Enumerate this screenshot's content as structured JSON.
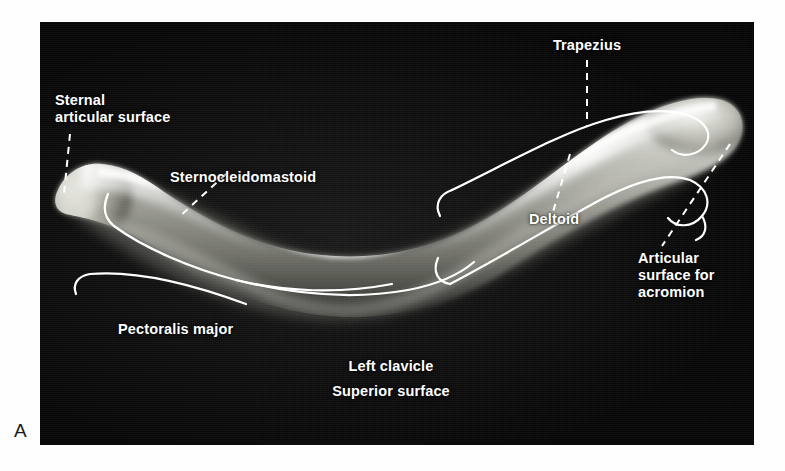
{
  "figure": {
    "panel_letter": "A",
    "caption_lines": [
      "Left clavicle",
      "Superior surface"
    ],
    "background_color": "#050505",
    "label_color": "#ffffff",
    "overlay_color": "#ffffff",
    "page_background": "#ffffff"
  },
  "labels": {
    "sternal_articular_surface": {
      "line1": "Sternal",
      "line2": "articular surface"
    },
    "sternocleidomastoid": "Sternocleidomastoid",
    "trapezius": "Trapezius",
    "deltoid": "Deltoid",
    "articular_surface_for_acromion": {
      "line1": "Articular",
      "line2": "surface for",
      "line3": "acromion"
    },
    "pectoralis_major": "Pectoralis major",
    "left_clavicle": "Left clavicle",
    "superior_surface": "Superior surface"
  }
}
